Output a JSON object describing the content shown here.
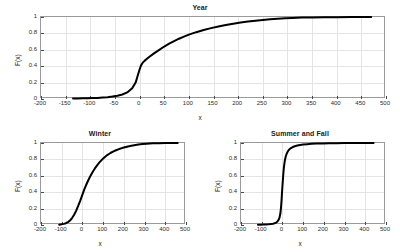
{
  "figure": {
    "background": "#ffffff",
    "curve_color": "#000000",
    "grid_color": "#e4e4e4",
    "axis_color": "#9a9a9a"
  },
  "chart_data": [
    {
      "type": "line",
      "id": "year",
      "title": "Year",
      "xlabel": "x",
      "ylabel": "F(x)",
      "xlim": [
        -200,
        500
      ],
      "ylim": [
        0,
        1
      ],
      "grid": true,
      "legend": "none",
      "xticks": [
        -200,
        -150,
        -100,
        -50,
        0,
        50,
        100,
        150,
        200,
        250,
        300,
        350,
        400,
        450,
        500
      ],
      "xticklabels": [
        "-200",
        "-150",
        "-100",
        "-50",
        "0",
        "50",
        "100",
        "150",
        "200",
        "250",
        "300",
        "350",
        "400",
        "450",
        "500"
      ],
      "yticks": [
        0,
        0.2,
        0.4,
        0.6,
        0.8,
        1
      ],
      "yticklabels": [
        "0",
        "0.2",
        "0.4",
        "0.6",
        "0.8",
        "1"
      ],
      "series": [
        {
          "name": "Year ECDF",
          "x": [
            -135,
            -125,
            -115,
            -105,
            -95,
            -85,
            -75,
            -65,
            -55,
            -45,
            -35,
            -25,
            -15,
            -8,
            -4,
            0,
            3,
            6,
            10,
            15,
            20,
            30,
            40,
            50,
            60,
            70,
            80,
            90,
            100,
            115,
            130,
            145,
            160,
            175,
            190,
            205,
            220,
            235,
            250,
            265,
            280,
            295,
            310,
            330,
            350,
            375,
            400,
            430,
            455,
            470
          ],
          "y": [
            0.005,
            0.006,
            0.008,
            0.009,
            0.011,
            0.013,
            0.017,
            0.022,
            0.03,
            0.04,
            0.055,
            0.08,
            0.13,
            0.2,
            0.28,
            0.36,
            0.41,
            0.44,
            0.465,
            0.49,
            0.515,
            0.56,
            0.6,
            0.64,
            0.675,
            0.705,
            0.735,
            0.76,
            0.785,
            0.815,
            0.842,
            0.864,
            0.884,
            0.902,
            0.918,
            0.932,
            0.944,
            0.955,
            0.964,
            0.972,
            0.979,
            0.985,
            0.989,
            0.993,
            0.995,
            0.997,
            0.998,
            0.999,
            0.999,
            1.0
          ]
        }
      ]
    },
    {
      "type": "line",
      "id": "winter",
      "title": "Winter",
      "xlabel": "x",
      "ylabel": "F(x)",
      "xlim": [
        -200,
        500
      ],
      "ylim": [
        0,
        1
      ],
      "grid": true,
      "legend": "none",
      "xticks": [
        -200,
        -100,
        0,
        100,
        200,
        300,
        400,
        500
      ],
      "xticklabels": [
        "-200",
        "-100",
        "0",
        "100",
        "200",
        "300",
        "400",
        "500"
      ],
      "yticks": [
        0,
        0.2,
        0.4,
        0.6,
        0.8,
        1
      ],
      "yticklabels": [
        "0",
        "0.2",
        "0.4",
        "0.6",
        "0.8",
        "1"
      ],
      "series": [
        {
          "name": "Winter ECDF",
          "x": [
            -112,
            -100,
            -90,
            -80,
            -70,
            -60,
            -50,
            -40,
            -30,
            -20,
            -10,
            0,
            10,
            20,
            30,
            40,
            50,
            60,
            70,
            80,
            90,
            100,
            110,
            120,
            135,
            150,
            165,
            180,
            195,
            210,
            230,
            250,
            270,
            290,
            310,
            340,
            370,
            400,
            430,
            460
          ],
          "y": [
            0.004,
            0.008,
            0.014,
            0.022,
            0.035,
            0.055,
            0.085,
            0.125,
            0.175,
            0.235,
            0.3,
            0.37,
            0.44,
            0.5,
            0.555,
            0.605,
            0.65,
            0.69,
            0.725,
            0.757,
            0.785,
            0.81,
            0.833,
            0.853,
            0.878,
            0.898,
            0.915,
            0.929,
            0.941,
            0.951,
            0.963,
            0.973,
            0.981,
            0.987,
            0.991,
            0.996,
            0.998,
            0.999,
            0.999,
            1.0
          ]
        }
      ]
    },
    {
      "type": "line",
      "id": "summer-and-fall",
      "title": "Summer and Fall",
      "xlabel": "x",
      "ylabel": "F(x)",
      "xlim": [
        -200,
        500
      ],
      "ylim": [
        0,
        1
      ],
      "grid": true,
      "legend": "none",
      "xticks": [
        -200,
        -100,
        0,
        100,
        200,
        300,
        400,
        500
      ],
      "xticklabels": [
        "-200",
        "-100",
        "0",
        "100",
        "200",
        "300",
        "400",
        "500"
      ],
      "yticks": [
        0,
        0.2,
        0.4,
        0.6,
        0.8,
        1
      ],
      "yticklabels": [
        "0",
        "0.2",
        "0.4",
        "0.6",
        "0.8",
        "1"
      ],
      "series": [
        {
          "name": "Summer and Fall ECDF",
          "x": [
            -118,
            -105,
            -92,
            -80,
            -68,
            -56,
            -46,
            -38,
            -30,
            -24,
            -18,
            -14,
            -10,
            -7,
            -4,
            -2,
            0,
            2,
            4,
            6,
            9,
            12,
            16,
            20,
            26,
            33,
            41,
            50,
            60,
            72,
            85,
            100,
            120,
            140,
            165,
            195,
            225,
            260,
            300,
            345,
            390,
            425,
            440
          ],
          "y": [
            0.003,
            0.004,
            0.005,
            0.007,
            0.009,
            0.012,
            0.016,
            0.021,
            0.03,
            0.042,
            0.065,
            0.09,
            0.14,
            0.21,
            0.31,
            0.4,
            0.47,
            0.545,
            0.615,
            0.675,
            0.74,
            0.79,
            0.835,
            0.866,
            0.898,
            0.921,
            0.938,
            0.951,
            0.961,
            0.969,
            0.975,
            0.981,
            0.986,
            0.99,
            0.993,
            0.995,
            0.997,
            0.998,
            0.999,
            0.999,
            1.0,
            1.0,
            1.0
          ]
        }
      ]
    }
  ]
}
